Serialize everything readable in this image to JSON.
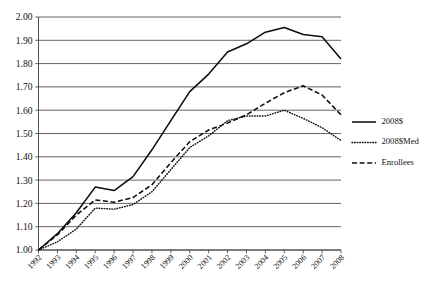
{
  "chart_data": {
    "type": "line",
    "title": "",
    "subtitle": "",
    "xlabel": "",
    "ylabel": "",
    "ylim": [
      1.0,
      2.0
    ],
    "ytick_step": 0.1,
    "grid": true,
    "grid_orientation": "horizontal",
    "legend_position": "right",
    "x": [
      1992,
      1993,
      1994,
      1995,
      1996,
      1997,
      1998,
      1999,
      2000,
      2001,
      2002,
      2003,
      2004,
      2005,
      2006,
      2007,
      2008
    ],
    "categories": [
      "1992",
      "1993",
      "1994",
      "1995",
      "1996",
      "1997",
      "1998",
      "1999",
      "2000",
      "2001",
      "2002",
      "2003",
      "2004",
      "2005",
      "2006",
      "2007",
      "2008"
    ],
    "ytick_labels": [
      "1.00",
      "1.10",
      "1.20",
      "1.30",
      "1.40",
      "1.50",
      "1.60",
      "1.70",
      "1.80",
      "1.90",
      "2.00"
    ],
    "ytick_values": [
      1.0,
      1.1,
      1.2,
      1.3,
      1.4,
      1.5,
      1.6,
      1.7,
      1.8,
      1.9,
      2.0
    ],
    "series": [
      {
        "name": "2008$",
        "style": "solid",
        "color": "#0d0d0d",
        "values": [
          1.0,
          1.07,
          1.16,
          1.27,
          1.255,
          1.315,
          1.43,
          1.555,
          1.68,
          1.755,
          1.85,
          1.885,
          1.935,
          1.955,
          1.925,
          1.915,
          1.82
        ]
      },
      {
        "name": "2008$Med",
        "style": "dotted",
        "color": "#0d0d0d",
        "values": [
          1.0,
          1.035,
          1.09,
          1.18,
          1.175,
          1.195,
          1.25,
          1.345,
          1.44,
          1.49,
          1.555,
          1.575,
          1.575,
          1.6,
          1.565,
          1.525,
          1.47
        ]
      },
      {
        "name": "Enrollees",
        "style": "dashed",
        "color": "#0d0d0d",
        "values": [
          1.0,
          1.065,
          1.15,
          1.215,
          1.205,
          1.225,
          1.28,
          1.375,
          1.465,
          1.515,
          1.545,
          1.58,
          1.63,
          1.675,
          1.705,
          1.665,
          1.58
        ]
      }
    ],
    "legend": [
      {
        "label": "2008$",
        "style": "solid"
      },
      {
        "label": "2008$Med",
        "style": "dotted"
      },
      {
        "label": "Enrollees",
        "style": "dashed"
      }
    ]
  }
}
